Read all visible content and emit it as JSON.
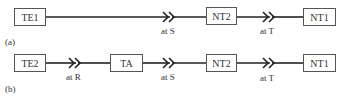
{
  "diagram": {
    "rows": [
      {
        "label": "(a)",
        "boxes": [
          "TE1",
          "NT2",
          "NT1"
        ],
        "reference_points": [
          "at S",
          "at T"
        ]
      },
      {
        "label": "(b)",
        "boxes": [
          "TE2",
          "TA",
          "NT2",
          "NT1"
        ],
        "reference_points": [
          "at R",
          "at S",
          "at T"
        ]
      }
    ],
    "colors": {
      "line": "#222222",
      "box_border": "#555555",
      "text": "#333333"
    }
  }
}
